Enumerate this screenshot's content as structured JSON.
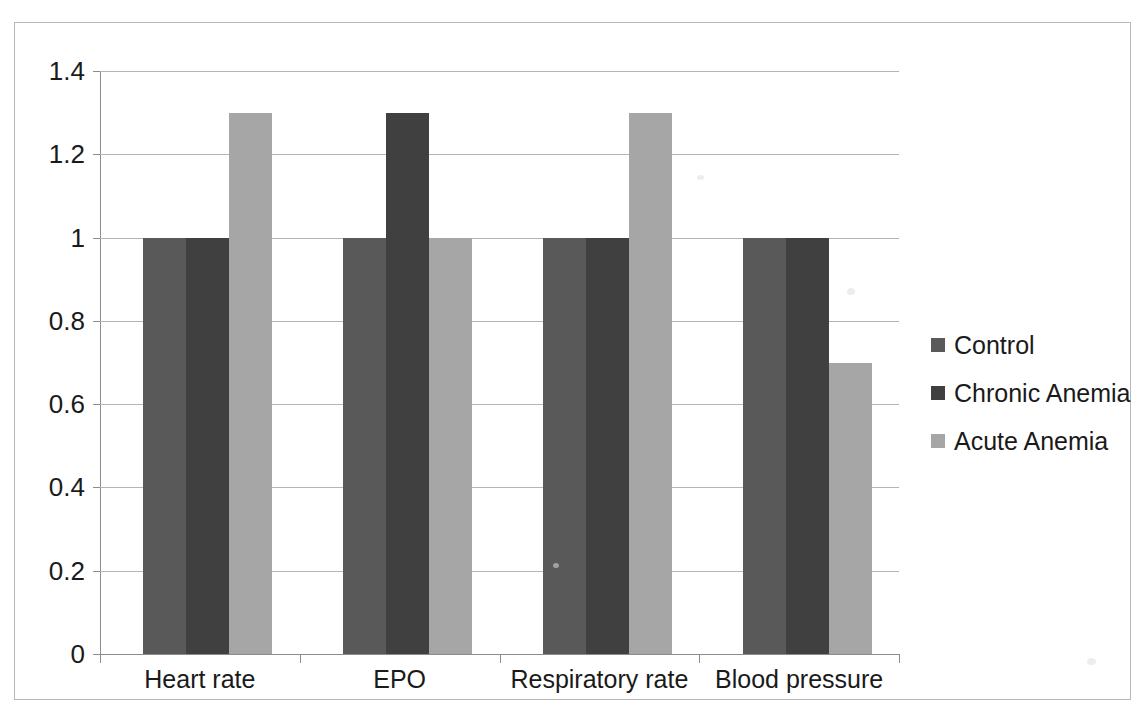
{
  "chart_data": {
    "type": "bar",
    "title": "",
    "xlabel": "",
    "ylabel": "",
    "categories": [
      "Heart rate",
      "EPO",
      "Respiratory rate",
      "Blood pressure"
    ],
    "series": [
      {
        "name": "Control",
        "color": "#595959",
        "values": [
          1,
          1,
          1,
          1
        ]
      },
      {
        "name": "Chronic Anemia",
        "color": "#404040",
        "values": [
          1,
          1.3,
          1,
          1
        ]
      },
      {
        "name": "Acute Anemia",
        "color": "#a6a6a6",
        "values": [
          1.3,
          1,
          1.3,
          0.7
        ]
      }
    ],
    "ylim": [
      0,
      1.4
    ],
    "ytick_labels": [
      "0",
      "0.2",
      "0.4",
      "0.6",
      "0.8",
      "1",
      "1.2",
      "1.4"
    ],
    "ytick_values": [
      0,
      0.2,
      0.4,
      0.6,
      0.8,
      1,
      1.2,
      1.4
    ],
    "grid": true,
    "grid_axis": "y",
    "legend_position": "right",
    "bar_group_gap": true,
    "plot_border": false
  },
  "axes": {
    "y_axis_name": "y-axis",
    "x_axis_name": "x-axis"
  },
  "frame": {
    "border_color": "#b8b8b8",
    "background": "#ffffff"
  }
}
